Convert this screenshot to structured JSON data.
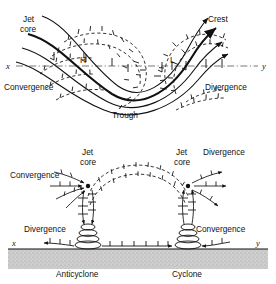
{
  "figure": {
    "background": "#ffffff",
    "ink": "#111111",
    "ground_color": "#c9c9c9"
  },
  "upper_panel": {
    "name": "plan-view-upper-level-wave",
    "axis_x_label": "x",
    "axis_y_label": "y",
    "labels": {
      "jet_core": "Jet\ncore",
      "jet_core_line1": "Jet",
      "jet_core_line2": "core",
      "crest": "Crest",
      "trough": "Trough",
      "convergence": "Convergence",
      "divergence": "Divergence",
      "high": "H",
      "low": "L"
    }
  },
  "lower_panel": {
    "name": "cross-section-vertical-circulation",
    "axis_x_label": "x",
    "axis_y_label": "y",
    "labels": {
      "jet_core_left_line1": "Jet",
      "jet_core_left_line2": "core",
      "jet_core_right_line1": "Jet",
      "jet_core_right_line2": "core",
      "convergence_upper": "Convergence",
      "divergence_upper": "Divergence",
      "divergence_surface": "Divergence",
      "convergence_surface": "Convergence",
      "anticyclone": "Anticyclone",
      "cyclone": "Cyclone"
    }
  }
}
